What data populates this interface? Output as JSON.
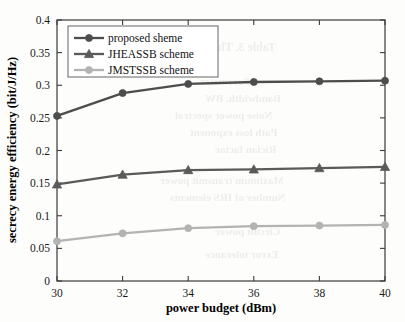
{
  "chart_data": {
    "type": "line",
    "title": "",
    "xlabel": "power budget (dBm)",
    "ylabel": "secrecy energy efficiency (bit/J/Hz)",
    "x": [
      30,
      32,
      34,
      36,
      38,
      40
    ],
    "xlim": [
      30,
      40
    ],
    "ylim": [
      0,
      0.4
    ],
    "xticks": [
      "30",
      "32",
      "34",
      "36",
      "38",
      "40"
    ],
    "yticks": [
      "0",
      "0.05",
      "0.1",
      "0.15",
      "0.2",
      "0.25",
      "0.3",
      "0.35",
      "0.4"
    ],
    "ytick_values": [
      0,
      0.05,
      0.1,
      0.15,
      0.2,
      0.25,
      0.3,
      0.35,
      0.4
    ],
    "grid": false,
    "legend_position": "upper left",
    "series": [
      {
        "name": "proposed sheme",
        "values": [
          0.253,
          0.288,
          0.302,
          0.305,
          0.306,
          0.307
        ],
        "color": "#4d4d4d",
        "marker": "circle"
      },
      {
        "name": "JHEASSB scheme",
        "values": [
          0.148,
          0.163,
          0.17,
          0.171,
          0.173,
          0.175
        ],
        "color": "#5a5a5a",
        "marker": "triangle"
      },
      {
        "name": "JMSTSSB scheme",
        "values": [
          0.061,
          0.073,
          0.081,
          0.084,
          0.085,
          0.086
        ],
        "color": "#b3b3b3",
        "marker": "circle"
      }
    ]
  },
  "ghost_text": [
    {
      "text": "Table 3. The simu",
      "x": 185,
      "y": 40,
      "size": 12
    },
    {
      "text": "Parameter",
      "x": 200,
      "y": 75,
      "size": 11
    },
    {
      "text": "Bandwidth, BW",
      "x": 205,
      "y": 92,
      "size": 11
    },
    {
      "text": "Noise power spectral",
      "x": 175,
      "y": 109,
      "size": 11
    },
    {
      "text": "Path loss exponent",
      "x": 190,
      "y": 126,
      "size": 11
    },
    {
      "text": "Rician factor",
      "x": 215,
      "y": 143,
      "size": 11
    },
    {
      "text": "Maximum transmit power",
      "x": 160,
      "y": 174,
      "size": 11
    },
    {
      "text": "Number of IRS elements",
      "x": 170,
      "y": 191,
      "size": 11
    },
    {
      "text": "Circuit power",
      "x": 215,
      "y": 225,
      "size": 11
    },
    {
      "text": "Error tolerance",
      "x": 205,
      "y": 248,
      "size": 11
    }
  ]
}
